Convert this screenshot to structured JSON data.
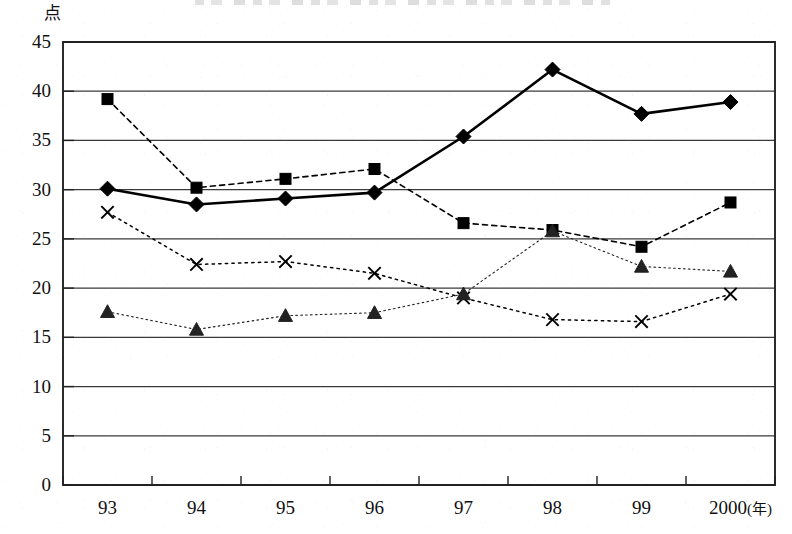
{
  "chart_data": {
    "type": "line",
    "title": "",
    "xlabel": "年",
    "ylabel": "点",
    "ylim": [
      0,
      45
    ],
    "ytick_step": 5,
    "grid": true,
    "legend": "none",
    "categories": [
      "93",
      "94",
      "95",
      "96",
      "97",
      "98",
      "99",
      "2000"
    ],
    "yticks": [
      "0",
      "5",
      "10",
      "15",
      "20",
      "25",
      "30",
      "35",
      "40",
      "45"
    ],
    "xticks": [
      "93",
      "94",
      "95",
      "96",
      "97",
      "98",
      "99",
      "2000"
    ],
    "x_axis_unit_label": "(年)",
    "y_axis_unit_label": "点",
    "series": [
      {
        "name": "series-square",
        "marker": "square",
        "line_style": "dashed",
        "line_width": 1.6,
        "color": "#000000",
        "values": [
          39.2,
          30.2,
          31.1,
          32.1,
          26.6,
          25.9,
          24.2,
          28.7
        ]
      },
      {
        "name": "series-diamond",
        "marker": "diamond",
        "line_style": "solid",
        "line_width": 2.6,
        "color": "#000000",
        "values": [
          30.1,
          28.5,
          29.1,
          29.7,
          35.4,
          42.2,
          37.7,
          38.9
        ]
      },
      {
        "name": "series-cross",
        "marker": "x",
        "line_style": "dotted",
        "line_width": 1.5,
        "color": "#000000",
        "values": [
          27.7,
          22.4,
          22.7,
          21.5,
          19.0,
          16.8,
          16.6,
          19.4
        ]
      },
      {
        "name": "series-triangle",
        "marker": "triangle",
        "line_style": "dotted",
        "line_width": 1.1,
        "color": "#222222",
        "values": [
          17.6,
          15.8,
          17.2,
          17.5,
          19.4,
          25.8,
          22.2,
          21.7
        ]
      }
    ]
  },
  "axes": {
    "plot_left": 63,
    "plot_right": 775,
    "plot_top": 42,
    "plot_bottom": 485
  },
  "colors": {
    "ink": "#1a1a1a",
    "grid": "#3a3a3a",
    "frame": "#222222",
    "background": "#ffffff"
  }
}
